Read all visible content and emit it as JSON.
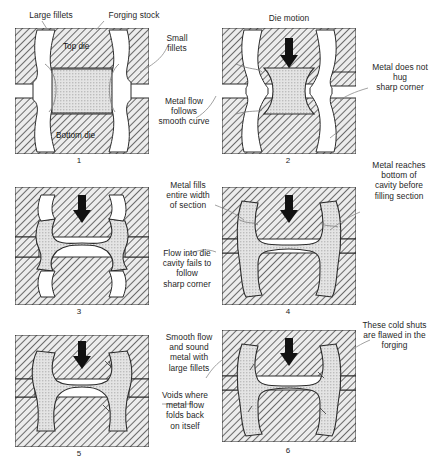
{
  "figure": {
    "type": "process-diagram",
    "rows": 3,
    "cols": 2,
    "panel_count": 6
  },
  "panels": [
    {
      "id": "panel-1",
      "number": "1",
      "column": "left",
      "row": 1,
      "fillet_type": "large",
      "stage": "start",
      "description": "Rectangular forging stock placed between open top and bottom dies with large fillets",
      "inner_labels": [
        {
          "name": "top-die",
          "text": "Top die"
        },
        {
          "name": "bottom-die",
          "text": "Bottom die"
        }
      ],
      "has_die_motion_arrow": false
    },
    {
      "id": "panel-2",
      "number": "2",
      "column": "right",
      "row": 1,
      "fillet_type": "small",
      "stage": "start",
      "description": "Stock upset between dies with sharp corners; die motion arrow pressing downward",
      "inner_labels": [],
      "has_die_motion_arrow": true
    },
    {
      "id": "panel-3",
      "number": "3",
      "column": "left",
      "row": 2,
      "fillet_type": "large",
      "stage": "middle",
      "description": "Metal spreads and fills entire width of section with smooth flow",
      "inner_labels": [],
      "has_die_motion_arrow": true
    },
    {
      "id": "panel-4",
      "number": "4",
      "column": "right",
      "row": 2,
      "fillet_type": "small",
      "stage": "middle",
      "description": "Metal reaches bottom of cavity before filling the section",
      "inner_labels": [],
      "has_die_motion_arrow": true
    },
    {
      "id": "panel-5",
      "number": "5",
      "column": "left",
      "row": 3,
      "fillet_type": "large",
      "stage": "final",
      "description": "Finished forging with smooth flow and sound metal",
      "inner_labels": [],
      "has_die_motion_arrow": true
    },
    {
      "id": "panel-6",
      "number": "6",
      "column": "right",
      "row": 3,
      "fillet_type": "small",
      "stage": "final",
      "description": "Finished forging containing cold shuts at the sharp corners",
      "inner_labels": [],
      "has_die_motion_arrow": true
    }
  ],
  "annotations": [
    {
      "name": "annotation-large-fillets",
      "text": "Large fillets",
      "align": "center",
      "points_to": "panel-1"
    },
    {
      "name": "annotation-forging-stock",
      "text": "Forging stock",
      "align": "center",
      "points_to": "panel-1"
    },
    {
      "name": "annotation-small-fillets",
      "text": "Small\nfillets",
      "lines": [
        "Small",
        "fillets"
      ],
      "align": "center",
      "points_to": "panel-2"
    },
    {
      "name": "annotation-die-motion",
      "text": "Die motion",
      "align": "center",
      "points_to": "panel-2"
    },
    {
      "name": "annotation-metal-flow-smooth",
      "lines": [
        "Metal flow",
        "follows",
        "smooth curve"
      ],
      "align": "center",
      "points_to": "panel-1"
    },
    {
      "name": "annotation-metal-does-not-hug",
      "lines": [
        "Metal does not",
        "hug",
        "sharp corner"
      ],
      "align": "center",
      "points_to": "panel-2"
    },
    {
      "name": "annotation-metal-fills-width",
      "lines": [
        "Metal fills",
        "entire width",
        "of section"
      ],
      "align": "center",
      "points_to": "panel-3"
    },
    {
      "name": "annotation-flow-fails-corner",
      "lines": [
        "Flow into die",
        "cavity fails to",
        "follow",
        "sharp corner"
      ],
      "align": "center",
      "points_to": "panel-3"
    },
    {
      "name": "annotation-metal-reaches-bottom",
      "lines": [
        "Metal reaches",
        "bottom of",
        "cavity before",
        "filling section"
      ],
      "align": "center",
      "points_to": "panel-4"
    },
    {
      "name": "annotation-smooth-flow-sound-metal",
      "lines": [
        "Smooth flow",
        "and sound",
        "metal with",
        "large fillets"
      ],
      "align": "center",
      "points_to": "panel-5"
    },
    {
      "name": "annotation-voids",
      "lines": [
        "Voids where",
        "metal flow",
        "folds back",
        "on itself"
      ],
      "align": "center",
      "points_to": "panel-5"
    },
    {
      "name": "annotation-cold-shuts",
      "lines": [
        "These cold shuts",
        "are flawed in the",
        "forging"
      ],
      "align": "center",
      "points_to": "panel-6"
    }
  ],
  "colors": {
    "ink": "#1a1a1a",
    "hatch_line": "#4a4a4a",
    "die_fill": "#e9e9e9",
    "stock_fill": "#d8d8d8",
    "void_fill": "#ffffff",
    "arrow_fill": "#111111",
    "leader_line": "#6a6a6a",
    "background": "#ffffff"
  }
}
